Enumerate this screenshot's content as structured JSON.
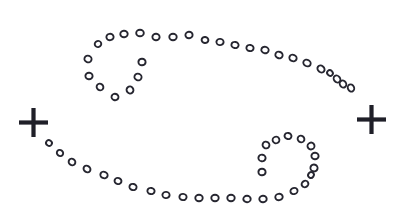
{
  "canvas": {
    "width": 395,
    "height": 217,
    "background_color": "#ffffff",
    "ink_color": "#1f1f28",
    "title": "Cancer zodiac symbol drawn as a dotted stipple glyph"
  },
  "marks": {
    "left_cross": {
      "name": "left-plus-mark",
      "label": "+",
      "cx": 33.5,
      "cy": 122.5,
      "arm_length": 14.5,
      "thickness": 4.2,
      "color": "#1f1f28"
    },
    "right_cross": {
      "name": "right-plus-mark",
      "label": "+",
      "cx": 371.5,
      "cy": 119.5,
      "arm_length": 14.5,
      "thickness": 4.2,
      "color": "#1f1f28"
    }
  },
  "dot_style": {
    "shape": "open-ellipse",
    "radius_x": 3.5,
    "radius_y": 3.1,
    "stroke_width": 1.9,
    "stroke_color": "#262630",
    "fill_color": "#ffffff"
  },
  "strokes": [
    {
      "name": "upper-arc",
      "description": "Top sweeping arc of the Cancer glyph running left-to-right then curving down on the right side",
      "dots": [
        {
          "x": 98,
          "y": 44,
          "rx": 3.3,
          "ry": 3.0,
          "rot": -18
        },
        {
          "x": 110,
          "y": 37,
          "rx": 3.6,
          "ry": 3.2,
          "rot": -10
        },
        {
          "x": 124,
          "y": 34,
          "rx": 3.7,
          "ry": 3.3,
          "rot": -5
        },
        {
          "x": 140,
          "y": 33,
          "rx": 3.8,
          "ry": 3.3,
          "rot": 0
        },
        {
          "x": 156,
          "y": 37,
          "rx": 3.6,
          "ry": 3.2,
          "rot": 5
        },
        {
          "x": 173,
          "y": 37,
          "rx": 3.7,
          "ry": 3.2,
          "rot": 0
        },
        {
          "x": 189,
          "y": 35,
          "rx": 3.6,
          "ry": 3.2,
          "rot": -3
        },
        {
          "x": 205,
          "y": 40,
          "rx": 3.4,
          "ry": 3.0,
          "rot": 6
        },
        {
          "x": 220,
          "y": 42,
          "rx": 3.6,
          "ry": 3.1,
          "rot": 8
        },
        {
          "x": 235,
          "y": 45,
          "rx": 3.6,
          "ry": 3.1,
          "rot": 10
        },
        {
          "x": 250,
          "y": 48,
          "rx": 3.6,
          "ry": 3.1,
          "rot": 12
        },
        {
          "x": 265,
          "y": 50,
          "rx": 3.7,
          "ry": 3.2,
          "rot": 14
        },
        {
          "x": 279,
          "y": 55,
          "rx": 3.7,
          "ry": 3.2,
          "rot": 20
        },
        {
          "x": 293,
          "y": 58,
          "rx": 3.7,
          "ry": 3.2,
          "rot": 24
        },
        {
          "x": 307,
          "y": 63,
          "rx": 3.8,
          "ry": 3.2,
          "rot": 30
        },
        {
          "x": 321,
          "y": 69,
          "rx": 3.8,
          "ry": 3.2,
          "rot": 38
        },
        {
          "x": 330,
          "y": 73,
          "rx": 3.0,
          "ry": 2.7,
          "rot": 45
        },
        {
          "x": 337,
          "y": 79,
          "rx": 3.7,
          "ry": 3.1,
          "rot": 52
        },
        {
          "x": 343,
          "y": 84,
          "rx": 3.7,
          "ry": 3.1,
          "rot": 58
        },
        {
          "x": 351,
          "y": 88,
          "rx": 3.7,
          "ry": 3.1,
          "rot": 64
        }
      ]
    },
    {
      "name": "upper-inner-curl",
      "description": "Inner spiral curl of the upper half of the Cancer glyph",
      "dots": [
        {
          "x": 88,
          "y": 59,
          "rx": 3.3,
          "ry": 3.6,
          "rot": -70
        },
        {
          "x": 89,
          "y": 76,
          "rx": 3.3,
          "ry": 3.6,
          "rot": -85
        },
        {
          "x": 100,
          "y": 87,
          "rx": 3.5,
          "ry": 3.2,
          "rot": 40
        },
        {
          "x": 115,
          "y": 97,
          "rx": 3.5,
          "ry": 3.2,
          "rot": 20
        },
        {
          "x": 130,
          "y": 90,
          "rx": 3.4,
          "ry": 3.5,
          "rot": -40
        },
        {
          "x": 138,
          "y": 77,
          "rx": 3.3,
          "ry": 3.6,
          "rot": -70
        },
        {
          "x": 142,
          "y": 62,
          "rx": 3.3,
          "ry": 3.6,
          "rot": -88
        }
      ]
    },
    {
      "name": "lower-arc",
      "description": "Bottom sweeping arc of the Cancer glyph running from lower-left up to the right curl",
      "dots": [
        {
          "x": 49,
          "y": 143,
          "rx": 3.0,
          "ry": 2.8,
          "rot": 35
        },
        {
          "x": 60,
          "y": 153,
          "rx": 3.3,
          "ry": 3.0,
          "rot": 40
        },
        {
          "x": 72,
          "y": 162,
          "rx": 3.5,
          "ry": 3.1,
          "rot": 38
        },
        {
          "x": 87,
          "y": 169,
          "rx": 3.6,
          "ry": 3.1,
          "rot": 32
        },
        {
          "x": 104,
          "y": 175,
          "rx": 3.7,
          "ry": 3.2,
          "rot": 24
        },
        {
          "x": 118,
          "y": 181,
          "rx": 3.5,
          "ry": 3.1,
          "rot": 20
        },
        {
          "x": 133,
          "y": 187,
          "rx": 3.6,
          "ry": 3.1,
          "rot": 16
        },
        {
          "x": 151,
          "y": 191,
          "rx": 3.6,
          "ry": 3.1,
          "rot": 12
        },
        {
          "x": 166,
          "y": 195,
          "rx": 3.6,
          "ry": 3.1,
          "rot": 8
        },
        {
          "x": 183,
          "y": 197,
          "rx": 3.6,
          "ry": 3.1,
          "rot": 4
        },
        {
          "x": 199,
          "y": 198,
          "rx": 3.7,
          "ry": 3.2,
          "rot": 0
        },
        {
          "x": 215,
          "y": 198,
          "rx": 3.7,
          "ry": 3.2,
          "rot": 0
        },
        {
          "x": 231,
          "y": 198,
          "rx": 3.7,
          "ry": 3.2,
          "rot": 0
        },
        {
          "x": 247,
          "y": 199,
          "rx": 3.7,
          "ry": 3.2,
          "rot": -2
        },
        {
          "x": 263,
          "y": 199,
          "rx": 3.7,
          "ry": 3.2,
          "rot": -4
        },
        {
          "x": 279,
          "y": 197,
          "rx": 3.7,
          "ry": 3.2,
          "rot": -8
        },
        {
          "x": 294,
          "y": 191,
          "rx": 3.6,
          "ry": 3.1,
          "rot": -18
        }
      ]
    },
    {
      "name": "lower-inner-curl",
      "description": "Inner spiral curl of the lower half of the Cancer glyph",
      "dots": [
        {
          "x": 305,
          "y": 184,
          "rx": 3.5,
          "ry": 3.1,
          "rot": -32
        },
        {
          "x": 311,
          "y": 175,
          "rx": 3.0,
          "ry": 2.8,
          "rot": -55
        },
        {
          "x": 314,
          "y": 168,
          "rx": 3.4,
          "ry": 3.6,
          "rot": -72
        },
        {
          "x": 315,
          "y": 156,
          "rx": 3.3,
          "ry": 3.6,
          "rot": -85
        },
        {
          "x": 311,
          "y": 146,
          "rx": 3.4,
          "ry": 3.5,
          "rot": 70
        },
        {
          "x": 301,
          "y": 139,
          "rx": 3.5,
          "ry": 3.2,
          "rot": 40
        },
        {
          "x": 288,
          "y": 136,
          "rx": 3.5,
          "ry": 3.1,
          "rot": 10
        },
        {
          "x": 276,
          "y": 140,
          "rx": 3.4,
          "ry": 3.3,
          "rot": -25
        },
        {
          "x": 266,
          "y": 145,
          "rx": 3.3,
          "ry": 3.5,
          "rot": -55
        },
        {
          "x": 262,
          "y": 158,
          "rx": 3.3,
          "ry": 3.6,
          "rot": -82
        },
        {
          "x": 262,
          "y": 172,
          "rx": 3.3,
          "ry": 3.6,
          "rot": -88
        }
      ]
    }
  ]
}
